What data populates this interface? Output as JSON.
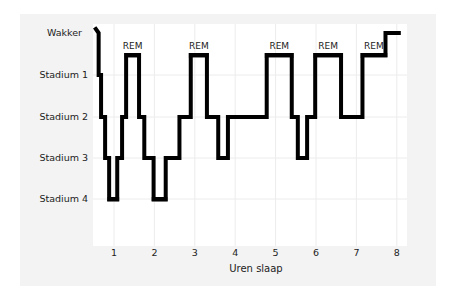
{
  "chart_data": {
    "type": "line",
    "subtype": "step (hypnogram)",
    "title": "",
    "xlabel": "Uren slaap",
    "ylabel": "",
    "x_ticks": [
      "1",
      "2",
      "3",
      "4",
      "5",
      "6",
      "7",
      "8"
    ],
    "y_categories": [
      "Wakker",
      "Stadium 1",
      "Stadium 2",
      "Stadium 3",
      "Stadium 4"
    ],
    "xlim": [
      0.5,
      8.25
    ],
    "grid": true,
    "legend": null,
    "rem_label": "REM",
    "colors": {
      "line": "#000000",
      "rem_bar": "#8a8a8a",
      "deep_bar": "#777777",
      "panel": "#f3f3f3",
      "plot": "#ffffff",
      "grid": "#ececec"
    },
    "steps": [
      {
        "x": 0.55,
        "stage": "Wakker"
      },
      {
        "x": 0.62,
        "stage": "Stadium 1"
      },
      {
        "x": 0.68,
        "stage": "Stadium 2"
      },
      {
        "x": 0.78,
        "stage": "Stadium 3"
      },
      {
        "x": 0.88,
        "stage": "Stadium 4"
      },
      {
        "x": 1.08,
        "stage": "Stadium 3"
      },
      {
        "x": 1.2,
        "stage": "Stadium 2"
      },
      {
        "x": 1.3,
        "stage": "REM"
      },
      {
        "x": 1.62,
        "stage": "Stadium 2"
      },
      {
        "x": 1.75,
        "stage": "Stadium 3"
      },
      {
        "x": 1.98,
        "stage": "Stadium 4"
      },
      {
        "x": 2.28,
        "stage": "Stadium 3"
      },
      {
        "x": 2.62,
        "stage": "Stadium 2"
      },
      {
        "x": 2.9,
        "stage": "REM"
      },
      {
        "x": 3.3,
        "stage": "Stadium 2"
      },
      {
        "x": 3.58,
        "stage": "Stadium 3"
      },
      {
        "x": 3.82,
        "stage": "Stadium 2"
      },
      {
        "x": 4.78,
        "stage": "REM"
      },
      {
        "x": 5.4,
        "stage": "Stadium 2"
      },
      {
        "x": 5.55,
        "stage": "Stadium 3"
      },
      {
        "x": 5.78,
        "stage": "Stadium 2"
      },
      {
        "x": 5.98,
        "stage": "REM"
      },
      {
        "x": 6.62,
        "stage": "Stadium 2"
      },
      {
        "x": 7.15,
        "stage": "REM"
      },
      {
        "x": 7.72,
        "stage": "Wakker"
      },
      {
        "x": 8.05,
        "stage": "end"
      }
    ],
    "rem_periods": [
      [
        1.3,
        1.62
      ],
      [
        2.9,
        3.3
      ],
      [
        4.78,
        5.4
      ],
      [
        5.98,
        6.62
      ],
      [
        7.15,
        7.72
      ]
    ],
    "stage4_periods": [
      [
        0.88,
        1.08
      ],
      [
        1.98,
        2.28
      ]
    ]
  }
}
